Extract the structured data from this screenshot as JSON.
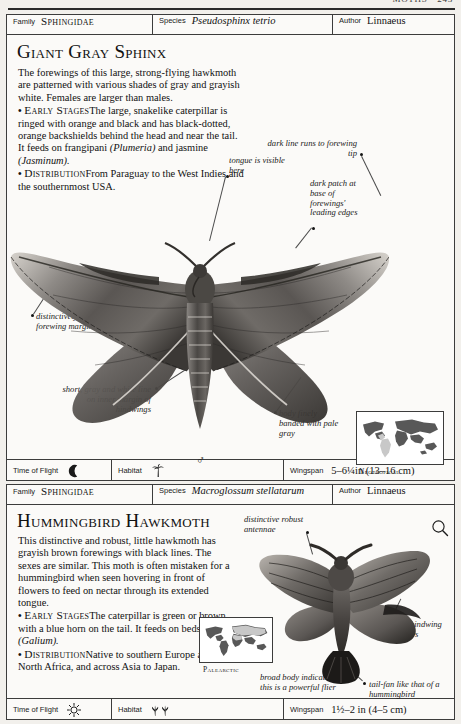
{
  "page": {
    "folio": "MOTHS • 243"
  },
  "entries": [
    {
      "id_strip": {
        "family_label": "Family",
        "family_value": "Sphingidae",
        "species_label": "Species",
        "species_value": "Pseudosphinx tetrio",
        "author_label": "Author",
        "author_value": "Linnaeus"
      },
      "common_name": "Giant Gray Sphinx",
      "description": {
        "intro": "The forewings of this large, strong-flying hawkmoth are patterned with various shades of gray and grayish white. Females are larger than males.",
        "early_stages_head": "Early Stages",
        "early_stages_text": "The large, snakelike caterpillar is ringed with orange and black and has black-dotted, orange backshields behind the head and near the tail. It feeds on frangipani ",
        "early_stages_italic_1": "(Plumeria)",
        "early_stages_mid": " and jasmine ",
        "early_stages_italic_2": "(Jasminum).",
        "distribution_head": "Distribution",
        "distribution_text": "From Paraguay to the West Indies and the southernmost USA."
      },
      "annotations": [
        {
          "name": "dark-line-forewing-tip",
          "text": "dark line runs to forewing tip"
        },
        {
          "name": "dark-patch-leading-edges",
          "text": "dark patch at base of forewings' leading edges"
        },
        {
          "name": "tongue-visible",
          "text": "tongue is visible here"
        },
        {
          "name": "scalloped-margins",
          "text": "distinctively scalloped forewing margins"
        },
        {
          "name": "inner-margin-line",
          "text": "short, gray and white line on inner margin of hindwings"
        },
        {
          "name": "banded-body",
          "text": "body finely banded with pale gray"
        }
      ],
      "gender_symbol": "♂",
      "map_caption": "Neotropical",
      "data_strip": {
        "flight_label": "Time of Flight",
        "flight_icon": "moon-icon",
        "habitat_label": "Habitat",
        "habitat_icon": "palm-tree-icon",
        "wingspan_label": "Wingspan",
        "wingspan_value": "5–6¼in (13–16 cm)"
      }
    },
    {
      "id_strip": {
        "family_label": "Family",
        "family_value": "Sphingidae",
        "species_label": "Species",
        "species_value": "Macroglossum stellatarum",
        "author_label": "Author",
        "author_value": "Linnaeus"
      },
      "common_name": "Hummingbird Hawkmoth",
      "description": {
        "intro": "This distinctive and robust, little hawkmoth has grayish brown forewings with black lines. The sexes are similar. This moth is often mistaken for a hummingbird when seen hovering in front of flowers to feed on nectar through its extended tongue.",
        "early_stages_head": "Early Stages",
        "early_stages_text": "The caterpillar is green or brown with a blue horn on the tail. It feeds on bedstraw ",
        "early_stages_italic_1": "(Galium).",
        "distribution_head": "Distribution",
        "distribution_text": "Native to southern Europe and North Africa, and across Asia to Japan."
      },
      "annotations": [
        {
          "name": "robust-antennae",
          "text": "distinctive robust antennae"
        },
        {
          "name": "dark-hindwing-borders",
          "text": "dark hindwing borders"
        },
        {
          "name": "broad-body",
          "text": "broad body indicates this is a powerful flier"
        },
        {
          "name": "tail-fan",
          "text": "tail-fan like that of a hummingbird"
        }
      ],
      "gender_symbol": "♀",
      "map_caption": "Palearctic",
      "data_strip": {
        "flight_label": "Time of Flight",
        "flight_icon": "sun-icon",
        "habitat_label": "Habitat",
        "habitat_icon": "shrubs-icon",
        "wingspan_label": "Wingspan",
        "wingspan_value": "1½–2 in (4–5 cm)"
      }
    }
  ],
  "colors": {
    "page_background": "#f2f0ec",
    "panel_background": "#fbfaf8",
    "rule": "#3c3c3c",
    "ink": "#111111",
    "map_land": "#585858",
    "map_range": "#c8c8c8"
  }
}
